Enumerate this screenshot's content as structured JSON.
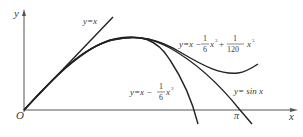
{
  "diagram": {
    "axes": {
      "x_label": "x",
      "y_label": "y",
      "origin_label": "O",
      "pi_label": "π"
    },
    "curves": [
      {
        "id": "line",
        "label_lhs": "y=x",
        "expression": "y = x"
      },
      {
        "id": "cubic",
        "label_lhs": "y=x −",
        "frac_num": "1",
        "frac_den": "6",
        "label_rhs": "x",
        "exp": "3",
        "expression": "y = x - (1/6)x^3"
      },
      {
        "id": "quintic",
        "label_lhs": "y=x −",
        "frac1_num": "1",
        "frac1_den": "6",
        "mid": "x",
        "exp1": "3",
        "plus": "+",
        "frac2_num": "1",
        "frac2_den": "120",
        "tail": "x",
        "exp2": "5",
        "expression": "y = x - (1/6)x^3 + (1/120)x^5"
      },
      {
        "id": "sine",
        "label": "y= sin x",
        "expression": "y = sin x"
      }
    ],
    "colors": {
      "curve": "#222222",
      "axis": "#555555",
      "text": "#3a3a3a",
      "background": "#ffffff"
    }
  }
}
